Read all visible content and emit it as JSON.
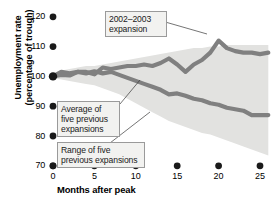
{
  "chart_data": {
    "type": "line",
    "title": "",
    "xlabel": "Months after peak",
    "ylabel": "Unemployment rate\n(percentage of trough)",
    "xlim": [
      0,
      26
    ],
    "ylim": [
      70,
      120
    ],
    "xticks": [
      0,
      5,
      10,
      15,
      20,
      25
    ],
    "yticks": [
      70,
      80,
      90,
      100,
      110,
      120
    ],
    "grid": false,
    "legend": "annotations",
    "annotations": [
      {
        "name": "2002-2003 expansion",
        "text": "2002–2003\nexpansion"
      },
      {
        "name": "average of five previous expansions",
        "text": "Average of\nfive previous\nexpansions"
      },
      {
        "name": "range of five previous expansions",
        "text": "Range of five\nprevious expansions"
      }
    ],
    "x": [
      0,
      1,
      2,
      3,
      4,
      5,
      6,
      7,
      8,
      9,
      10,
      11,
      12,
      13,
      14,
      15,
      16,
      17,
      18,
      19,
      20,
      21,
      22,
      23,
      24,
      25,
      26
    ],
    "series": [
      {
        "name": "2002-2003 expansion",
        "color": "#808080",
        "values": [
          100,
          101.5,
          101,
          101.5,
          101.5,
          100.7,
          103,
          102.5,
          103,
          103.5,
          103.5,
          104,
          103.5,
          104.5,
          106,
          104,
          101.5,
          104,
          105.5,
          108,
          112,
          109.5,
          108.5,
          108,
          108,
          107.5,
          108
        ]
      },
      {
        "name": "Average of five previous expansions",
        "color": "#808080",
        "values": [
          100,
          100.5,
          100.3,
          101.5,
          101,
          101.7,
          101,
          101.5,
          100.5,
          99.5,
          98.5,
          97.5,
          96.5,
          95.5,
          94,
          94.3,
          93.5,
          92.5,
          92,
          91,
          90.5,
          89.5,
          89,
          88.5,
          87,
          87,
          87
        ]
      }
    ],
    "band": {
      "name": "Range of five previous expansions",
      "color": "#e2e2e0",
      "upper": [
        100.5,
        102,
        102.5,
        103,
        103.5,
        103.5,
        104,
        104.5,
        105,
        105.5,
        106,
        106.5,
        107,
        107.5,
        108,
        108.5,
        109,
        109.5,
        109.5,
        110,
        110,
        110.5,
        110.5,
        110.5,
        110.5,
        110.5,
        110.5
      ],
      "lower": [
        99.5,
        99,
        98.5,
        98,
        97.5,
        97,
        96,
        95,
        94,
        92.5,
        91,
        89.5,
        88,
        86.5,
        85,
        84,
        83,
        82,
        81,
        80.5,
        79.5,
        78.5,
        77.5,
        76.5,
        75.5,
        74.5,
        73.5
      ]
    }
  },
  "axes": {
    "y_label": "Unemployment rate (percentage of trough)",
    "y_label_line1": "Unemployment rate",
    "y_label_line2": "(percentage of trough)",
    "x_label": "Months after peak",
    "yticks": [
      "120",
      "110",
      "100",
      "90",
      "80",
      "70"
    ],
    "xticks": [
      "0",
      "5",
      "10",
      "15",
      "20",
      "25"
    ]
  },
  "callouts": {
    "expansion": "2002–2003\nexpansion",
    "average": "Average of\nfive previous\nexpansions",
    "range": "Range of five\nprevious expansions"
  }
}
